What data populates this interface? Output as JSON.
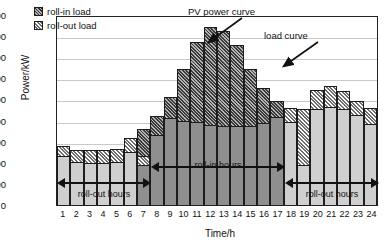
{
  "chart_data": {
    "type": "bar",
    "title": "",
    "xlabel": "Time/h",
    "ylabel": "Power/kW",
    "ylim": [
      0,
      4500
    ],
    "ytick_step": 500,
    "yticks": [
      4500,
      4000,
      3500,
      3000,
      2500,
      2000,
      1500,
      1000,
      500,
      0
    ],
    "grid": true,
    "legend_position": "top-left",
    "categories": [
      1,
      2,
      3,
      4,
      5,
      6,
      7,
      8,
      9,
      10,
      11,
      12,
      13,
      14,
      15,
      16,
      17,
      18,
      19,
      20,
      21,
      22,
      23,
      24
    ],
    "series": [
      {
        "name": "load curve",
        "values": [
          1150,
          1010,
          1000,
          1000,
          1020,
          1250,
          950,
          1650,
          2050,
          1980,
          1970,
          1890,
          1870,
          1870,
          1880,
          1940,
          2080,
          1970,
          950,
          2270,
          2320,
          2280,
          2130,
          1930
        ]
      },
      {
        "name": "roll-in load",
        "values": [
          0,
          0,
          0,
          0,
          0,
          0,
          650,
          450,
          500,
          1240,
          1900,
          2330,
          2260,
          1920,
          1350,
          820,
          380,
          0,
          0,
          0,
          0,
          0,
          0,
          0
        ]
      },
      {
        "name": "roll-out load",
        "values": [
          250,
          290,
          300,
          300,
          310,
          330,
          200,
          0,
          0,
          0,
          0,
          0,
          0,
          0,
          0,
          0,
          0,
          330,
          1330,
          460,
          510,
          420,
          330,
          370
        ]
      }
    ],
    "totals": [
      1400,
      1300,
      1300,
      1300,
      1330,
      1580,
      1800,
      2100,
      2550,
      3220,
      3870,
      4220,
      4130,
      3790,
      3230,
      2760,
      2460,
      2300,
      2280,
      2730,
      2830,
      2700,
      2460,
      2300
    ],
    "annotations": [
      {
        "text": "PV power curve",
        "points_to_hour": 14
      },
      {
        "text": "load curve",
        "points_to_hour": 20
      },
      {
        "text": "roll-out hours",
        "hours": [
          1,
          7
        ]
      },
      {
        "text": "roll-in hours",
        "hours": [
          8,
          17
        ]
      },
      {
        "text": "roll-out hours",
        "hours": [
          18,
          24
        ]
      }
    ]
  },
  "legend": {
    "items": [
      {
        "label": "roll-in load",
        "pattern": "dark-crosshatch"
      },
      {
        "label": "roll-out load",
        "pattern": "light-diagonal-hatch"
      }
    ]
  },
  "axes": {
    "y_title": "Power/kW",
    "x_title": "Time/h",
    "y_ticks": [
      "4500",
      "4000",
      "3500",
      "3000",
      "2500",
      "2000",
      "1500",
      "1000",
      "500",
      "0"
    ],
    "x_ticks": [
      "1",
      "2",
      "3",
      "4",
      "5",
      "6",
      "7",
      "8",
      "9",
      "10",
      "11",
      "12",
      "13",
      "14",
      "15",
      "16",
      "17",
      "18",
      "19",
      "20",
      "21",
      "22",
      "23",
      "24"
    ]
  },
  "callouts": {
    "pv_power_curve": "PV power curve",
    "load_curve": "load curve"
  },
  "spans": {
    "rollout_morning": "roll-out hours",
    "rollin": "roll-in hours",
    "rollout_evening": "roll-out hours"
  },
  "colors": {
    "base_light": "#cfcfcf",
    "base_dark": "#8f8f8f",
    "hatch_rollin": "#757575",
    "hatch_rollout": "#c4c4c4",
    "outline": "#1d1d1d",
    "grid": "#c9c9c9"
  }
}
